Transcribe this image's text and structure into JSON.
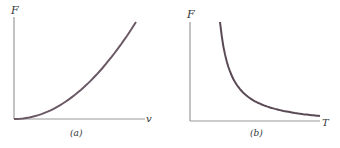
{
  "chart_data": [
    {
      "type": "line",
      "panel_label": "(a)",
      "title": "",
      "xlabel": "v",
      "ylabel": "F",
      "grid": false,
      "legend": null,
      "description": "F increases quadratically with v (F ∝ v²)",
      "x": [
        0,
        0.1,
        0.2,
        0.3,
        0.4,
        0.5,
        0.6,
        0.7,
        0.8,
        0.9,
        1.0
      ],
      "values": [
        0,
        0.01,
        0.04,
        0.09,
        0.16,
        0.25,
        0.36,
        0.49,
        0.64,
        0.81,
        1.0
      ]
    },
    {
      "type": "line",
      "panel_label": "(b)",
      "title": "",
      "xlabel": "T",
      "ylabel": "F",
      "grid": false,
      "legend": null,
      "description": "F decreases inversely with T (F ∝ 1/T)",
      "x": [
        0.1,
        0.15,
        0.2,
        0.3,
        0.4,
        0.5,
        0.6,
        0.7,
        0.8,
        0.9,
        1.0
      ],
      "values": [
        1.0,
        0.67,
        0.5,
        0.33,
        0.25,
        0.2,
        0.17,
        0.14,
        0.125,
        0.11,
        0.1
      ]
    }
  ],
  "panels": {
    "a": {
      "ylabel": "F",
      "xlabel": "v",
      "caption": "(a)"
    },
    "b": {
      "ylabel": "F",
      "xlabel": "T",
      "caption": "(b)"
    }
  },
  "colors": {
    "axis": "#9a9a9a",
    "curve": "#6b5a66",
    "text": "#333333"
  }
}
